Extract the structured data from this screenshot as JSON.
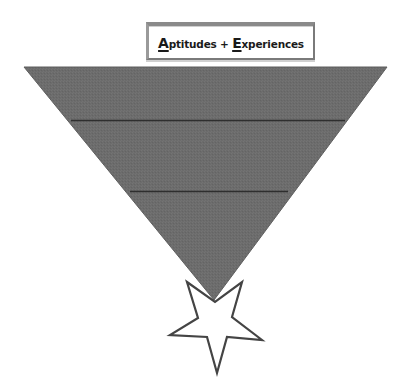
{
  "title": {
    "parts": [
      {
        "text": "A",
        "emphasis": true
      },
      {
        "text": "ptitudes + ",
        "emphasis": false
      },
      {
        "text": "E",
        "emphasis": true
      },
      {
        "text": "xperiences",
        "emphasis": false
      }
    ],
    "full_text": "Aptitudes + Experiences"
  },
  "funnel": {
    "shape": "inverted-triangle",
    "fill_color": "#6c6c6c",
    "divider_color": "#2e2e2e",
    "sections": 3,
    "section_labels": [
      "",
      "",
      ""
    ]
  },
  "star": {
    "shape": "five-point-star-inverted",
    "fill_color": "#ffffff",
    "stroke_color": "#444444"
  }
}
